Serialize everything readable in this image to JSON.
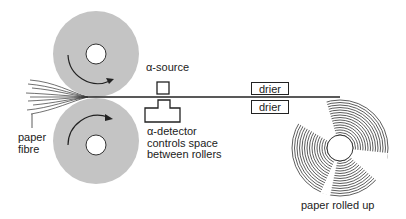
{
  "diagram": {
    "labels": {
      "alpha_source": "α-source",
      "alpha_detector_line1": "α-detector",
      "alpha_detector_line2": "controls space",
      "alpha_detector_line3": "between rollers",
      "paper_fibre_line1": "paper",
      "paper_fibre_line2": "fibre",
      "drier_top": "drier",
      "drier_bottom": "drier",
      "paper_rolled_up": "paper rolled up"
    },
    "components": [
      {
        "id": "top-roller",
        "type": "roller",
        "rotation": "clockwise"
      },
      {
        "id": "bottom-roller",
        "type": "roller",
        "rotation": "clockwise"
      },
      {
        "id": "alpha-source",
        "type": "source-box"
      },
      {
        "id": "alpha-detector",
        "type": "detector"
      },
      {
        "id": "drier-top",
        "type": "drier"
      },
      {
        "id": "drier-bottom",
        "type": "drier"
      },
      {
        "id": "paper-roll",
        "type": "roll"
      }
    ],
    "colors": {
      "roller": "#c4c4c4",
      "line": "#222222",
      "background": "#ffffff"
    }
  }
}
